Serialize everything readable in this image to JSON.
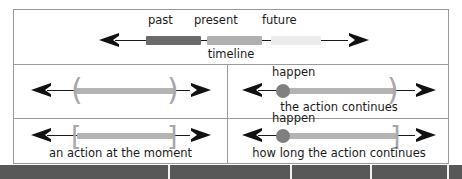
{
  "figure": {
    "rows": [
      {
        "name": "timeline-row",
        "segments": [
          {
            "label": "past",
            "color": "#6b6b6b"
          },
          {
            "label": "present",
            "color": "#b0b0b0"
          },
          {
            "label": "future",
            "color": "#ececec"
          }
        ],
        "caption": "timeline"
      },
      {
        "name": "middle-row",
        "cells": [
          {
            "name": "continuous-unbounded",
            "bracket_open": "(",
            "bracket_close": ")",
            "top_label": "",
            "caption": ""
          },
          {
            "name": "action-continues",
            "bracket_close": ")",
            "top_label": "happen",
            "caption": "the action continues"
          }
        ]
      },
      {
        "name": "bottom-row",
        "cells": [
          {
            "name": "action-at-the-moment",
            "bracket_open": "[",
            "bracket_close": "]",
            "top_label": "",
            "caption": "an action at the moment"
          },
          {
            "name": "how-long-action-continues",
            "bracket_close": "]",
            "top_label": "happen",
            "caption": "how long the action continues"
          }
        ]
      }
    ]
  },
  "colors": {
    "frame_border": "#9a9a9a",
    "arrow": "#111111",
    "bar": "#b4b4b4",
    "bracket": "#a8a8a8",
    "dot": "#808080",
    "strip": "#585858"
  }
}
